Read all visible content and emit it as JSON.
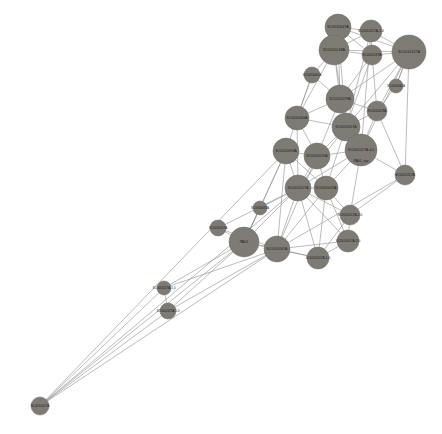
{
  "figure": {
    "kind": "network-graph",
    "background_color": "#ffffff",
    "width": 442,
    "height": 434
  },
  "style": {
    "node_fill": "#7e7a74",
    "node_stroke": "#6d6a64",
    "edge_color": "#8e8e8e",
    "edge_width": 0.65,
    "label_color": "#1d1d1d"
  },
  "chart_data": {
    "type": "scatter",
    "title": "",
    "subtitle": "",
    "xlabel": "",
    "ylabel": "",
    "grid": false,
    "legend": "none",
    "layout": "force-directed node-link diagram",
    "node_count": 28,
    "edge_count": 96,
    "nodes": [
      {
        "id": "n0",
        "label": "SC0010047A",
        "x": 338,
        "y": 27,
        "r": 13,
        "font": 3.6
      },
      {
        "id": "n1",
        "label": "SC0010117A-1.0",
        "x": 371,
        "y": 31,
        "r": 11,
        "font": 3.4
      },
      {
        "id": "n2",
        "label": "SC0010149A",
        "x": 334,
        "y": 50,
        "r": 15,
        "font": 3.7
      },
      {
        "id": "n3",
        "label": "SC0110117A",
        "x": 409,
        "y": 52,
        "r": 17,
        "font": 3.8
      },
      {
        "id": "n4",
        "label": "SC0010137A",
        "x": 372,
        "y": 55,
        "r": 10,
        "font": 3.2
      },
      {
        "id": "n5",
        "label": "SC0010079A",
        "x": 340,
        "y": 99,
        "r": 14,
        "font": 3.6
      },
      {
        "id": "n6",
        "label": "SC0010064A",
        "x": 297,
        "y": 118,
        "r": 12,
        "font": 3.5
      },
      {
        "id": "n7",
        "label": "SC0010057A",
        "x": 346,
        "y": 127,
        "r": 14,
        "font": 3.6
      },
      {
        "id": "n8",
        "label": "SC0010078A",
        "x": 377,
        "y": 111,
        "r": 10,
        "font": 3.2
      },
      {
        "id": "n9",
        "label": "SC0010094A",
        "x": 286,
        "y": 151,
        "r": 13,
        "font": 3.6
      },
      {
        "id": "n10",
        "label": "SC0010076A",
        "x": 317,
        "y": 156,
        "r": 13,
        "font": 3.6
      },
      {
        "id": "n11",
        "label": "SC0010117A-4.0",
        "x": 361,
        "y": 150,
        "r": 16,
        "font": 3.4
      },
      {
        "id": "n12",
        "label": "PA01_top",
        "x": 361,
        "y": 161,
        "r": 0,
        "font": 3.4
      },
      {
        "id": "n13",
        "label": "SC0010117A",
        "x": 405,
        "y": 175,
        "r": 10,
        "font": 3.3
      },
      {
        "id": "n14",
        "label": "SC0010117A",
        "x": 298,
        "y": 188,
        "r": 13,
        "font": 3.5
      },
      {
        "id": "n15",
        "label": "SC0010047A",
        "x": 326,
        "y": 188,
        "r": 12,
        "font": 3.5
      },
      {
        "id": "n16",
        "label": "SC0010017A-2.0",
        "x": 350,
        "y": 215,
        "r": 10,
        "font": 3.2
      },
      {
        "id": "n17",
        "label": "SC0010017A-3.0",
        "x": 348,
        "y": 241,
        "r": 11,
        "font": 3.2
      },
      {
        "id": "n18",
        "label": "SC0010017A-1.0",
        "x": 318,
        "y": 258,
        "r": 11,
        "font": 3.2
      },
      {
        "id": "n19",
        "label": "SC0010017A",
        "x": 218,
        "y": 228,
        "r": 8,
        "font": 3.1
      },
      {
        "id": "n20",
        "label": "PA01",
        "x": 244,
        "y": 242,
        "r": 15,
        "font": 3.6
      },
      {
        "id": "n21",
        "label": "SC0010007A",
        "x": 277,
        "y": 249,
        "r": 13,
        "font": 3.5
      },
      {
        "id": "n22",
        "label": "SC0010117A-1.0",
        "x": 164,
        "y": 288,
        "r": 7,
        "font": 3.0
      },
      {
        "id": "n23",
        "label": "SC0010117A-1.0",
        "x": 168,
        "y": 311,
        "r": 8,
        "font": 3.0
      },
      {
        "id": "n24",
        "label": "SC0010017A",
        "x": 40,
        "y": 406,
        "r": 9,
        "font": 3.1
      },
      {
        "id": "n25",
        "label": "SC0010061A",
        "x": 312,
        "y": 75,
        "r": 8,
        "font": 3.1
      },
      {
        "id": "n26",
        "label": "SC0010042A",
        "x": 396,
        "y": 86,
        "r": 7,
        "font": 3.0
      },
      {
        "id": "n27",
        "label": "SC0010033A",
        "x": 260,
        "y": 208,
        "r": 7,
        "font": 3.0
      }
    ],
    "edges": [
      [
        "n0",
        "n1"
      ],
      [
        "n0",
        "n2"
      ],
      [
        "n0",
        "n4"
      ],
      [
        "n0",
        "n3"
      ],
      [
        "n0",
        "n5"
      ],
      [
        "n0",
        "n7"
      ],
      [
        "n1",
        "n2"
      ],
      [
        "n1",
        "n4"
      ],
      [
        "n1",
        "n3"
      ],
      [
        "n1",
        "n7"
      ],
      [
        "n1",
        "n11"
      ],
      [
        "n2",
        "n4"
      ],
      [
        "n2",
        "n3"
      ],
      [
        "n2",
        "n5"
      ],
      [
        "n2",
        "n25"
      ],
      [
        "n2",
        "n6"
      ],
      [
        "n2",
        "n7"
      ],
      [
        "n3",
        "n4"
      ],
      [
        "n3",
        "n5"
      ],
      [
        "n3",
        "n7"
      ],
      [
        "n3",
        "n8"
      ],
      [
        "n3",
        "n11"
      ],
      [
        "n3",
        "n13"
      ],
      [
        "n3",
        "n26"
      ],
      [
        "n4",
        "n5"
      ],
      [
        "n4",
        "n7"
      ],
      [
        "n4",
        "n8"
      ],
      [
        "n5",
        "n6"
      ],
      [
        "n5",
        "n7"
      ],
      [
        "n5",
        "n8"
      ],
      [
        "n5",
        "n10"
      ],
      [
        "n5",
        "n11"
      ],
      [
        "n5",
        "n25"
      ],
      [
        "n6",
        "n7"
      ],
      [
        "n6",
        "n9"
      ],
      [
        "n6",
        "n10"
      ],
      [
        "n6",
        "n14"
      ],
      [
        "n6",
        "n25"
      ],
      [
        "n7",
        "n8"
      ],
      [
        "n7",
        "n10"
      ],
      [
        "n7",
        "n11"
      ],
      [
        "n7",
        "n14"
      ],
      [
        "n7",
        "n15"
      ],
      [
        "n8",
        "n11"
      ],
      [
        "n8",
        "n13"
      ],
      [
        "n8",
        "n26"
      ],
      [
        "n9",
        "n10"
      ],
      [
        "n9",
        "n14"
      ],
      [
        "n9",
        "n20"
      ],
      [
        "n9",
        "n21"
      ],
      [
        "n9",
        "n15"
      ],
      [
        "n10",
        "n11"
      ],
      [
        "n10",
        "n14"
      ],
      [
        "n10",
        "n15"
      ],
      [
        "n10",
        "n21"
      ],
      [
        "n11",
        "n13"
      ],
      [
        "n11",
        "n15"
      ],
      [
        "n11",
        "n16"
      ],
      [
        "n11",
        "n14"
      ],
      [
        "n13",
        "n16"
      ],
      [
        "n13",
        "n21"
      ],
      [
        "n14",
        "n15"
      ],
      [
        "n14",
        "n20"
      ],
      [
        "n14",
        "n21"
      ],
      [
        "n14",
        "n16"
      ],
      [
        "n14",
        "n17"
      ],
      [
        "n14",
        "n18"
      ],
      [
        "n14",
        "n27"
      ],
      [
        "n15",
        "n16"
      ],
      [
        "n15",
        "n17"
      ],
      [
        "n15",
        "n18"
      ],
      [
        "n15",
        "n21"
      ],
      [
        "n16",
        "n17"
      ],
      [
        "n16",
        "n18"
      ],
      [
        "n17",
        "n18"
      ],
      [
        "n17",
        "n21"
      ],
      [
        "n18",
        "n21"
      ],
      [
        "n18",
        "n20"
      ],
      [
        "n19",
        "n20"
      ],
      [
        "n19",
        "n21"
      ],
      [
        "n19",
        "n14"
      ],
      [
        "n20",
        "n21"
      ],
      [
        "n20",
        "n22"
      ],
      [
        "n20",
        "n23"
      ],
      [
        "n20",
        "n24"
      ],
      [
        "n20",
        "n27"
      ],
      [
        "n21",
        "n22"
      ],
      [
        "n21",
        "n23"
      ],
      [
        "n21",
        "n24"
      ],
      [
        "n22",
        "n23"
      ],
      [
        "n22",
        "n24"
      ],
      [
        "n23",
        "n24"
      ],
      [
        "n24",
        "n14"
      ],
      [
        "n24",
        "n9"
      ],
      [
        "n25",
        "n6"
      ],
      [
        "n26",
        "n3"
      ],
      [
        "n27",
        "n20"
      ],
      [
        "n27",
        "n9"
      ]
    ]
  }
}
